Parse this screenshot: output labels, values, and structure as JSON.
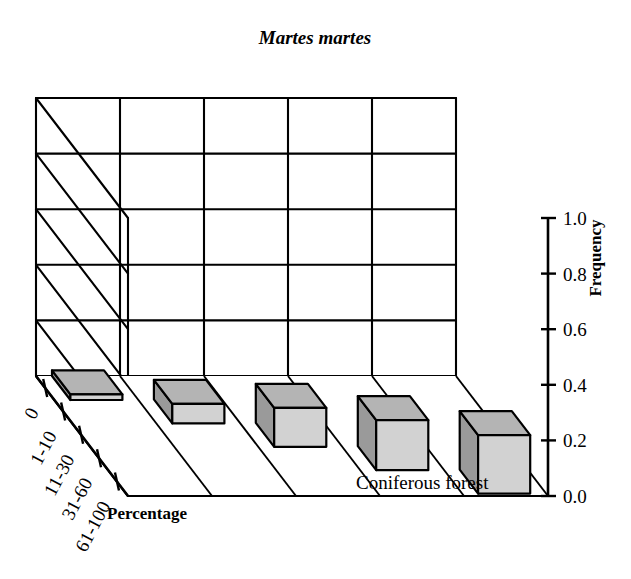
{
  "title": "Martes martes",
  "axes": {
    "y_label": "Frequency",
    "x_label": "Percentage",
    "z_label": "Coniferous forest",
    "y_ticks": [
      "0.0",
      "0.2",
      "0.4",
      "0.6",
      "0.8",
      "1.0"
    ],
    "x_ticks": [
      "0",
      "1-10",
      "11-30",
      "31-60",
      "61-100"
    ]
  },
  "colors": {
    "bar_front": "#d2d2d2",
    "bar_side": "#9a9a9a",
    "bar_top": "#b4b4b4",
    "outline": "#000000",
    "background": "#ffffff"
  },
  "chart_data": {
    "type": "bar",
    "title": "Martes martes",
    "xlabel": "Percentage",
    "ylabel": "Frequency",
    "zlabel": "Coniferous forest",
    "categories": [
      "0",
      "1-10",
      "11-30",
      "31-60",
      "61-100"
    ],
    "values": [
      0.02,
      0.07,
      0.14,
      0.18,
      0.21
    ],
    "ylim": [
      0.0,
      1.0
    ],
    "ytick_values": [
      0.0,
      0.2,
      0.4,
      0.6,
      0.8,
      1.0
    ],
    "grid": true,
    "legend": null,
    "projection": "3d",
    "series": [
      {
        "name": "Coniferous forest",
        "values": [
          0.02,
          0.07,
          0.14,
          0.18,
          0.21
        ]
      }
    ]
  }
}
